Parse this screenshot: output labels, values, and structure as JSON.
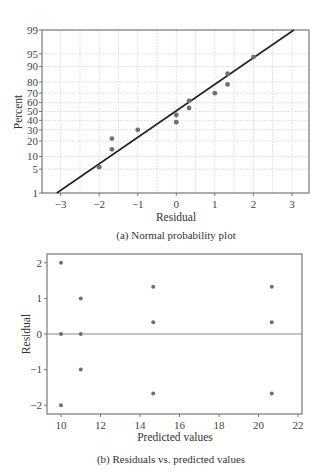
{
  "chart_data": [
    {
      "type": "scatter",
      "title": "",
      "caption": "(a) Normal probability plot",
      "xlabel": "Residual",
      "ylabel": "Percent",
      "xlim": [
        -3.3,
        3.4
      ],
      "x_ticks": [
        -3,
        -2,
        -1,
        0,
        1,
        2,
        3
      ],
      "x_tick_labels": [
        "−3",
        "−2",
        "−1",
        "0",
        "1",
        "2",
        "3"
      ],
      "y_scale": "normal-probability",
      "y_ticks": [
        1,
        5,
        10,
        20,
        30,
        40,
        50,
        60,
        70,
        80,
        90,
        95,
        99
      ],
      "y_tick_labels": [
        "1",
        "5",
        "10",
        "20",
        "30",
        "40",
        "50",
        "60",
        "70",
        "80",
        "90",
        "95",
        "99"
      ],
      "grid": true,
      "points": [
        {
          "x": -2.0,
          "y": 5.6
        },
        {
          "x": -1.67,
          "y": 14
        },
        {
          "x": -1.67,
          "y": 22
        },
        {
          "x": -1.0,
          "y": 30
        },
        {
          "x": 0.0,
          "y": 38
        },
        {
          "x": 0.0,
          "y": 46
        },
        {
          "x": 0.33,
          "y": 54
        },
        {
          "x": 0.33,
          "y": 62
        },
        {
          "x": 1.0,
          "y": 70
        },
        {
          "x": 1.33,
          "y": 78
        },
        {
          "x": 1.33,
          "y": 86
        },
        {
          "x": 2.0,
          "y": 94
        }
      ],
      "reference_line": {
        "from": {
          "x": -3.1,
          "y": 1
        },
        "to": {
          "x": 3.05,
          "y": 99
        }
      }
    },
    {
      "type": "scatter",
      "title": "",
      "caption": "(b) Residuals vs. predicted values",
      "xlabel": "Predicted values",
      "ylabel": "Residual",
      "xlim": [
        9.3,
        22.2
      ],
      "ylim": [
        -2.25,
        2.25
      ],
      "x_ticks": [
        10,
        12,
        14,
        16,
        18,
        20,
        22
      ],
      "x_tick_labels": [
        "10",
        "12",
        "14",
        "16",
        "18",
        "20",
        "22"
      ],
      "y_ticks": [
        -2,
        -1,
        0,
        1,
        2
      ],
      "y_tick_labels": [
        "−2",
        "−1",
        "0",
        "1",
        "2"
      ],
      "grid": false,
      "zero_line": true,
      "points": [
        {
          "x": 10.0,
          "y": 2.0
        },
        {
          "x": 10.0,
          "y": 0.0
        },
        {
          "x": 10.0,
          "y": -2.0
        },
        {
          "x": 11.0,
          "y": 1.0
        },
        {
          "x": 11.0,
          "y": 0.0
        },
        {
          "x": 11.0,
          "y": -1.0
        },
        {
          "x": 14.67,
          "y": 1.33
        },
        {
          "x": 14.67,
          "y": 0.33
        },
        {
          "x": 14.67,
          "y": -1.67
        },
        {
          "x": 20.67,
          "y": 1.33
        },
        {
          "x": 20.67,
          "y": 0.33
        },
        {
          "x": 20.67,
          "y": -1.67
        }
      ]
    }
  ],
  "colors": {
    "frame": "#777777",
    "grid": "#d9d9d9",
    "line": "#222222",
    "point": "#707070",
    "text": "#333333"
  }
}
